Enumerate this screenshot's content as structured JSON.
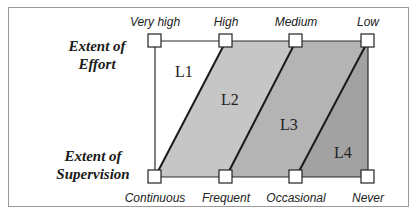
{
  "diagram": {
    "axes": {
      "top": {
        "title_line1": "Extent of",
        "title_line2": "Effort",
        "ticks": [
          "Very high",
          "High",
          "Medium",
          "Low"
        ]
      },
      "bottom": {
        "title_line1": "Extent of",
        "title_line2": "Supervision",
        "ticks": [
          "Continuous",
          "Frequent",
          "Occasional",
          "Never"
        ]
      }
    },
    "regions": [
      {
        "label": "L1",
        "color": "#ffffff"
      },
      {
        "label": "L2",
        "color": "#c6c6c6"
      },
      {
        "label": "L3",
        "color": "#b4b4b4"
      },
      {
        "label": "L4",
        "color": "#a2a2a2"
      }
    ],
    "colors": {
      "line": "#1a1a1a",
      "node_fill": "#ffffff",
      "frame": "#9a9a9a"
    }
  }
}
